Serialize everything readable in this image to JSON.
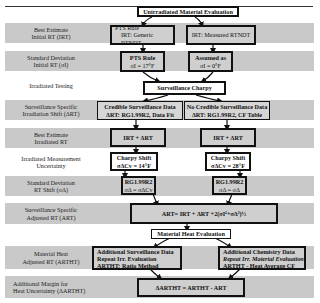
{
  "title": "Unirradiated Material Evaluation",
  "rows": [
    {
      "label": "Best Estimate\nInitial RT (IRT)"
    },
    {
      "label": "Standard Deviation\nInitial RT (σI)"
    },
    {
      "label": "Irradiated Testing"
    },
    {
      "label": "Surveillance Specific\nIrradiation Shift (ΔRT)"
    },
    {
      "label": "Best Estimate\nIrradiated RT"
    },
    {
      "label": "Irradiated Measurement\nUncertainty"
    },
    {
      "label": "Standard Deviation\nRT Shift (σΔ)"
    },
    {
      "label": "Surveillance Specific\nAdjusted RT (ART)"
    },
    {
      "label": "Material Heat\nAdjusted RT (ARTHT)"
    },
    {
      "label": "Additional Margin for\nHeat Uncertainty (ΔARTHT)"
    }
  ],
  "boxes": {
    "pts_rule_irt": {
      "line1": "PTS Rule",
      "line2": "IRT: Generic RTNDT"
    },
    "measured_irt": {
      "line1": "IRT: Measured RTNDT"
    },
    "pts_rule_sigma": {
      "line1": "PTS Rule",
      "line2": "σI = 17°F"
    },
    "assumed_sigma": {
      "line1": "Assumed as",
      "line2": "σI = 0°F"
    },
    "surveillance_charpy": {
      "line1": "Surveillance Charpy"
    },
    "credible": {
      "line1": "Credible Surveillance Data",
      "line2": "ΔRT: RG1.99R2, Data Fit"
    },
    "not_credible": {
      "line1": "No Credible Surveillance Data",
      "line2": "ΔRT: RG1.99R2, CF Table"
    },
    "irt_plus_left": {
      "line1": "IRT + ΔRT"
    },
    "irt_plus_right": {
      "line1": "IRT + ΔRT"
    },
    "charpy_left": {
      "line1": "Charpy Shift",
      "line2": "σΔCv = 14°F"
    },
    "charpy_right": {
      "line1": "Charpy Shift",
      "line2": "σΔCv = 28°F"
    },
    "rg_left": {
      "line1": "RG1.99R2",
      "line2": "σΔ = σΔCv"
    },
    "rg_right": {
      "line1": "RG1.99R2",
      "line2": "σΔ = σΔ"
    },
    "art_formula": {
      "line1": "ART= IRT + ΔRT +2(σI²+σΔ²)½"
    },
    "heat_eval": {
      "line1": "Material Heat Evaluation"
    },
    "add_surv": {
      "line1": "Additional Surveillance Data",
      "line2": "Repeat Irr. Evaluation",
      "line3": "ARTHT: Ratio Method"
    },
    "add_chem": {
      "line1": "Additional Chemistry Data",
      "line2": "Repeat Irr. Material Evaluation",
      "line3": "ARTHT - Heat Average CF"
    },
    "delta_art": {
      "line1": "ΔARTHT = ARTHT - ART"
    }
  },
  "colors": {
    "band": "#c9c9c9",
    "box_fill": "#cfcfcf",
    "border": "#111111"
  }
}
